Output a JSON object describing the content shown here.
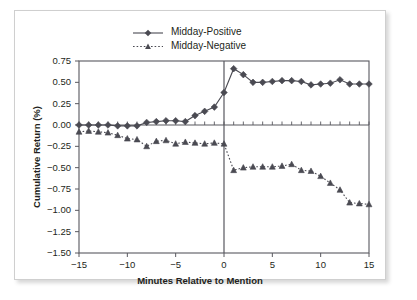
{
  "chart_data": {
    "type": "line",
    "title": "",
    "subtitle": "",
    "xlabel": "Minutes Relative to Mention",
    "ylabel": "Cumulative Return (%)",
    "xlim": [
      -15,
      15
    ],
    "ylim": [
      -1.5,
      0.75
    ],
    "xticks": [
      -15,
      -10,
      -5,
      0,
      5,
      10,
      15
    ],
    "xtick_labels": [
      "−15",
      "−10",
      "−5",
      "0",
      "5",
      "10",
      "15"
    ],
    "yticks": [
      0.75,
      0.5,
      0.25,
      0.0,
      -0.25,
      -0.5,
      -0.75,
      -1.0,
      -1.25,
      -1.5
    ],
    "ytick_labels": [
      "0.75",
      "0.50",
      "0.25",
      "0.00",
      "−0.25",
      "−0.50",
      "−0.75",
      "−1.00",
      "−1.25",
      "−1.50"
    ],
    "grid": false,
    "legend_position": "top-center",
    "zero_line": true,
    "event_line_x": 0,
    "x": [
      -15,
      -14,
      -13,
      -12,
      -11,
      -10,
      -9,
      -8,
      -7,
      -6,
      -5,
      -4,
      -3,
      -2,
      -1,
      0,
      1,
      2,
      3,
      4,
      5,
      6,
      7,
      8,
      9,
      10,
      11,
      12,
      13,
      14,
      15
    ],
    "series": [
      {
        "name": "Midday-Positive",
        "marker": "diamond",
        "linestyle": "solid",
        "color": "#4a4a52",
        "values": [
          0.0,
          0.0,
          0.0,
          0.0,
          -0.01,
          -0.01,
          -0.01,
          0.03,
          0.04,
          0.05,
          0.05,
          0.04,
          0.11,
          0.16,
          0.21,
          0.38,
          0.66,
          0.59,
          0.5,
          0.5,
          0.51,
          0.52,
          0.52,
          0.51,
          0.47,
          0.48,
          0.49,
          0.53,
          0.48,
          0.48,
          0.48
        ]
      },
      {
        "name": "Midday-Negative",
        "marker": "triangle",
        "linestyle": "dotted",
        "color": "#4a4a52",
        "values": [
          -0.08,
          -0.07,
          -0.08,
          -0.09,
          -0.12,
          -0.16,
          -0.17,
          -0.25,
          -0.19,
          -0.18,
          -0.22,
          -0.2,
          -0.21,
          -0.22,
          -0.21,
          -0.22,
          -0.53,
          -0.5,
          -0.49,
          -0.49,
          -0.49,
          -0.48,
          -0.46,
          -0.53,
          -0.54,
          -0.6,
          -0.68,
          -0.76,
          -0.91,
          -0.92,
          -0.93
        ]
      }
    ]
  },
  "legend": {
    "items": [
      {
        "label": "Midday-Positive"
      },
      {
        "label": "Midday-Negative"
      }
    ]
  }
}
